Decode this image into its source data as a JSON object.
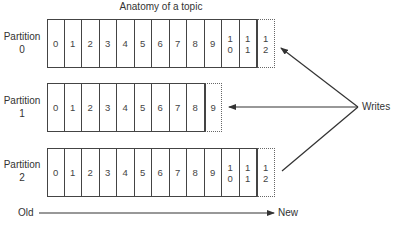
{
  "title": "Anatomy of a topic",
  "partitions": [
    {
      "label_line1": "Partition",
      "label_line2": "0",
      "offsets": [
        "0",
        "1",
        "2",
        "3",
        "4",
        "5",
        "6",
        "7",
        "8",
        "9",
        "10",
        "11"
      ],
      "next_offset": "12"
    },
    {
      "label_line1": "Partition",
      "label_line2": "1",
      "offsets": [
        "0",
        "1",
        "2",
        "3",
        "4",
        "5",
        "6",
        "7",
        "8"
      ],
      "next_offset": "9"
    },
    {
      "label_line1": "Partition",
      "label_line2": "2",
      "offsets": [
        "0",
        "1",
        "2",
        "3",
        "4",
        "5",
        "6",
        "7",
        "8",
        "9",
        "10",
        "11"
      ],
      "next_offset": "12"
    }
  ],
  "writes_label": "Writes",
  "axis": {
    "old_label": "Old",
    "new_label": "New"
  },
  "colors": {
    "line": "#333333",
    "cell_border": "#444444",
    "text": "#333333"
  }
}
